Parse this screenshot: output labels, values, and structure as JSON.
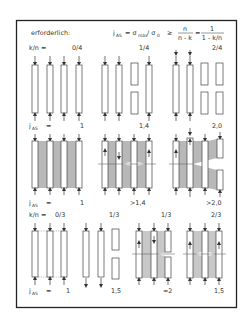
{
  "header": {
    "title": "erforderlich:",
    "formula_lhs": "j",
    "formula_lhs_sub": "AS",
    "formula_eq": "= σ",
    "formula_max_sub": "max",
    "formula_div": "/ σ",
    "formula_zero_sub": "0",
    "formula_ge": "≥",
    "frac1_num": "n",
    "frac1_den": "n - k",
    "formula_eq2": "=",
    "frac2_num": "1",
    "frac2_den": "1 - k/n"
  },
  "section1": {
    "kn_label": "k/n =",
    "groups": [
      {
        "ratio": "0/4",
        "jas_value": "1"
      },
      {
        "ratio": "1/4",
        "jas_value": "1,4"
      },
      {
        "ratio": "2/4",
        "jas_value": "2,0"
      }
    ],
    "jas_label": "j",
    "jas_sub": "AS",
    "jas_eq": "="
  },
  "section2": {
    "groups": [
      {
        "jas_value": "1"
      },
      {
        "jas_value": ">1,4"
      },
      {
        "jas_value": ">2,0"
      }
    ],
    "jas_label": "j",
    "jas_sub": "AS",
    "jas_eq": "="
  },
  "section3": {
    "kn_label": "k/n =",
    "groups": [
      {
        "ratio": "0/3",
        "jas_value": "1"
      },
      {
        "ratio": "1/3",
        "jas_value": "1,5"
      },
      {
        "ratio": "1/3",
        "jas_value": "≈2"
      },
      {
        "ratio": "2/3",
        "jas_value": "1,5"
      }
    ],
    "jas_label": "j",
    "jas_sub": "AS",
    "jas_eq": "="
  },
  "colors": {
    "frame": "#222222",
    "shade": "#b8b8b8",
    "text": "#333333",
    "background": "#ffffff"
  }
}
